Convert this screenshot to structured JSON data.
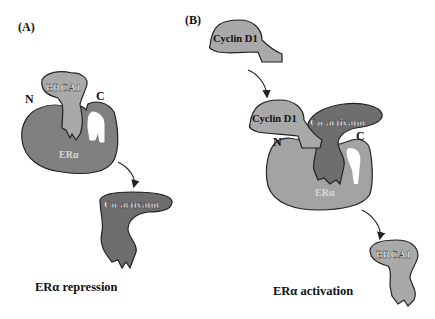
{
  "panels": [
    {
      "id": "A",
      "label": "(A)",
      "caption": "ERα repression",
      "receptor": {
        "name": "ERα",
        "color": "#7f7f7f"
      },
      "termini": {
        "n": "N",
        "c": "C"
      },
      "bound": {
        "name": "BRCA1",
        "color": "#a9a9a9"
      },
      "released": {
        "name": "Co-activator",
        "color": "#6e6e6e"
      }
    },
    {
      "id": "B",
      "label": "(B)",
      "caption": "ERα activation",
      "receptor": {
        "name": "ERα",
        "color": "#a3a3a3"
      },
      "termini": {
        "n": "N",
        "c": "C"
      },
      "incoming": {
        "name": "Cyclin D1",
        "color": "#a9a9a9"
      },
      "bound_cyclin": {
        "name": "Cyclin D1",
        "color": "#a9a9a9"
      },
      "bound_coactivator": {
        "name": "Co-activator",
        "color": "#6e6e6e"
      },
      "released": {
        "name": "BRCA1",
        "color": "#a9a9a9"
      }
    }
  ]
}
